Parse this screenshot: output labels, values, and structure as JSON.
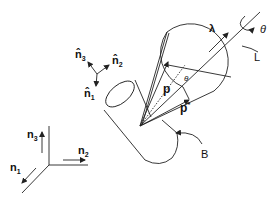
{
  "diagram": {
    "labels": {
      "lambda": "λ",
      "theta_rot": "θ",
      "theta_cone": "θ",
      "line_L": "L",
      "body_B": "B",
      "p": "p",
      "p_star": "p",
      "p_star_sup": "*",
      "n1": "n",
      "n1_sub": "1",
      "n2": "n",
      "n2_sub": "2",
      "n3": "n",
      "n3_sub": "3",
      "nh1": "n̂",
      "nh1_sub": "1",
      "nh2": "n̂",
      "nh2_sub": "2",
      "nh3": "n̂",
      "nh3_sub": "3"
    },
    "colors": {
      "stroke": "#222222",
      "background": "#ffffff"
    }
  }
}
